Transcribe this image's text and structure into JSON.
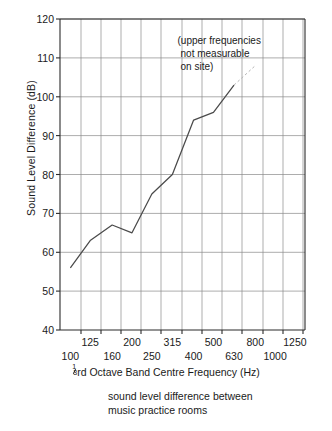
{
  "chart_data": {
    "type": "line",
    "title": "",
    "caption": [
      "sound level difference between",
      "music practice rooms"
    ],
    "xlabel": "rd Octave Band Centre Frequency (Hz)",
    "xlabel_fraction_num": "1",
    "xlabel_fraction_den": "3",
    "ylabel": "Sound Level Difference (dB)",
    "xscale": "log",
    "xlim": [
      89,
      1400
    ],
    "ylim": [
      40,
      120
    ],
    "grid": true,
    "legend": "none",
    "annotations": [
      {
        "text": [
          "(upper frequencies",
          "not measurable",
          "on site)"
        ],
        "x_hz": 560,
        "y_db": 114
      }
    ],
    "y_ticks": [
      40,
      50,
      60,
      70,
      80,
      90,
      100,
      110,
      120
    ],
    "x_ticks_upper": [
      125,
      200,
      315,
      500,
      800,
      1250
    ],
    "x_ticks_lower": [
      100,
      160,
      250,
      400,
      630,
      1000
    ],
    "x_ticks_all": [
      100,
      125,
      160,
      200,
      250,
      315,
      400,
      500,
      630,
      800,
      1000,
      1250
    ],
    "series": [
      {
        "name": "sound level difference",
        "style": "solid",
        "x": [
          100,
          125,
          160,
          200,
          250,
          315,
          400,
          500,
          630
        ],
        "y": [
          56,
          63,
          67,
          65,
          75,
          80,
          94,
          96,
          103
        ]
      },
      {
        "name": "extrapolated (not measurable)",
        "style": "dashed",
        "x": [
          630,
          800
        ],
        "y": [
          103,
          108
        ]
      }
    ]
  },
  "axis": {
    "y_tick_labels": [
      "120",
      "110",
      "100",
      "90",
      "80",
      "70",
      "60",
      "50",
      "40"
    ],
    "x_tick_labels_upper": [
      "125",
      "200",
      "315",
      "500",
      "800",
      "1250"
    ],
    "x_tick_labels_lower": [
      "100",
      "160",
      "250",
      "400",
      "630",
      "1000"
    ],
    "y_title": "Sound Level Difference (dB)",
    "x_title_suffix": "rd Octave Band Centre Frequency (Hz)"
  },
  "annotation": {
    "line1": "(upper frequencies",
    "line2": "not measurable",
    "line3": "on site)"
  },
  "caption": {
    "line1": "sound level difference between",
    "line2": "music practice rooms"
  },
  "colors": {
    "background": "#ffffff",
    "ink": "#1a1a1a",
    "grid": "#8a8a8a",
    "axis": "#2b2b2b",
    "data_line": "#4a4a4a"
  }
}
